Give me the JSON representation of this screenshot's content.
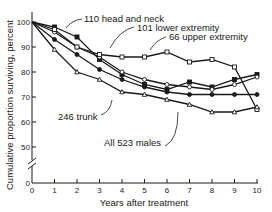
{
  "chart_data": {
    "type": "line",
    "title": "",
    "xlabel": "Years after treatment",
    "ylabel": "Cumulative proportion surviving, percent",
    "x": [
      0,
      1,
      2,
      3,
      4,
      5,
      6,
      7,
      8,
      9,
      10
    ],
    "xlim": [
      0,
      10
    ],
    "ylim": [
      50,
      100
    ],
    "y_axis_break": true,
    "y_ticks": [
      0,
      50,
      60,
      70,
      80,
      90,
      100
    ],
    "x_ticks": [
      0,
      1,
      2,
      3,
      4,
      5,
      6,
      7,
      8,
      9,
      10
    ],
    "grid": false,
    "legend": "inline annotations",
    "series": [
      {
        "name": "110 head and neck",
        "marker": "filled-square",
        "values": [
          100,
          98,
          94,
          85,
          79,
          75,
          73,
          76,
          74,
          77,
          79
        ]
      },
      {
        "name": "101 lower extremity",
        "marker": "open-circle",
        "values": [
          100,
          96,
          90,
          86,
          80,
          77,
          75,
          74,
          73,
          75,
          78
        ]
      },
      {
        "name": "66 upper extremity",
        "marker": "open-square",
        "values": [
          100,
          97,
          90,
          87,
          86,
          86,
          88,
          84,
          85,
          82,
          65
        ]
      },
      {
        "name": "246 trunk",
        "marker": "filled-circle",
        "values": [
          100,
          93,
          87,
          81,
          77,
          74,
          72,
          71,
          71,
          71,
          71
        ]
      },
      {
        "name": "All 523 males",
        "marker": "open-triangle",
        "values": [
          100,
          89,
          80,
          77,
          72,
          71,
          69,
          67,
          64,
          64,
          66
        ]
      }
    ]
  },
  "labels": {
    "ylabel": "Cumulative proportion surviving, percent",
    "xlabel": "Years after treatment",
    "head_neck": "110 head and neck",
    "lower_ext": "101 lower extremity",
    "upper_ext": "66 upper extremity",
    "trunk": "246 trunk",
    "all": "All 523 males"
  },
  "ticks": {
    "y": [
      "100",
      "90",
      "80",
      "70",
      "60",
      "50",
      "0"
    ],
    "x": [
      "0",
      "1",
      "2",
      "3",
      "4",
      "5",
      "6",
      "7",
      "8",
      "9",
      "10"
    ]
  }
}
